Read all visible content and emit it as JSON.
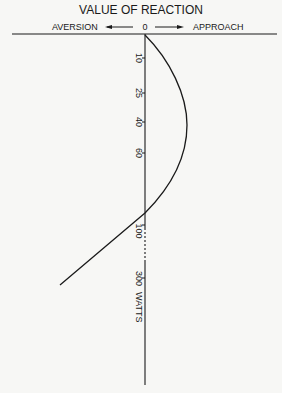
{
  "title": "VALUE OF REACTION",
  "axis_labels": {
    "left": "AVERSION",
    "center": "0",
    "right": "APPROACH",
    "unit": "WATTS"
  },
  "ticks": [
    {
      "label": "10",
      "y": 58
    },
    {
      "label": "25",
      "y": 93
    },
    {
      "label": "40",
      "y": 122
    },
    {
      "label": "60",
      "y": 153
    },
    {
      "label": "100",
      "y": 225
    },
    {
      "label": "300",
      "y": 278
    }
  ],
  "tick_300_suffix": "WATTS",
  "colors": {
    "ink": "#1a1a1a",
    "paper": "#f7f7f5"
  }
}
